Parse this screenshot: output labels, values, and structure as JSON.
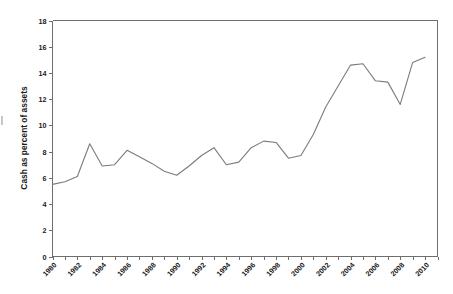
{
  "chart_data": {
    "type": "line",
    "title": "",
    "subtitle": "",
    "xlabel": "",
    "ylabel": "Cash as percent of assets",
    "xlim": [
      1980,
      2011
    ],
    "ylim": [
      0,
      18
    ],
    "y_ticks": [
      0,
      2,
      4,
      6,
      8,
      10,
      12,
      14,
      16,
      18
    ],
    "y_tick_labels": [
      "0",
      "2",
      "4",
      "6",
      "8",
      "10",
      "12",
      "14",
      "16",
      "18"
    ],
    "x_ticks": [
      1980,
      1981,
      1982,
      1983,
      1984,
      1985,
      1986,
      1987,
      1988,
      1989,
      1990,
      1991,
      1992,
      1993,
      1994,
      1995,
      1996,
      1997,
      1998,
      1999,
      2000,
      2001,
      2002,
      2003,
      2004,
      2005,
      2006,
      2007,
      2008,
      2009,
      2010,
      2011
    ],
    "x_tick_labels": [
      "1980",
      "1982",
      "1984",
      "1986",
      "1988",
      "1990",
      "1992",
      "1994",
      "1996",
      "1998",
      "2000",
      "2002",
      "2004",
      "2006",
      "2008",
      "2010"
    ],
    "x_tick_label_years": [
      1980,
      1982,
      1984,
      1986,
      1988,
      1990,
      1992,
      1994,
      1996,
      1998,
      2000,
      2002,
      2004,
      2006,
      2008,
      2010
    ],
    "x_tick_label_rotation_deg": 45,
    "grid": false,
    "legend": null,
    "legend_position": "none",
    "line_color": "#7b7b7b",
    "axis_color": "#6e6e6e",
    "x": [
      1980,
      1981,
      1982,
      1983,
      1984,
      1985,
      1986,
      1987,
      1988,
      1989,
      1990,
      1991,
      1992,
      1993,
      1994,
      1995,
      1996,
      1997,
      1998,
      1999,
      2000,
      2001,
      2002,
      2003,
      2004,
      2005,
      2006,
      2007,
      2008,
      2009,
      2010
    ],
    "values": [
      5.5,
      5.7,
      6.1,
      8.6,
      6.9,
      7.0,
      8.1,
      7.6,
      7.1,
      6.5,
      6.2,
      6.9,
      7.7,
      8.3,
      7.0,
      7.2,
      8.3,
      8.8,
      8.7,
      7.5,
      7.7,
      9.3,
      11.4,
      13.0,
      14.6,
      14.7,
      13.4,
      13.3,
      11.6,
      14.8,
      15.2
    ],
    "series": [
      {
        "name": "Cash as percent of assets",
        "values": [
          5.5,
          5.7,
          6.1,
          8.6,
          6.9,
          7.0,
          8.1,
          7.6,
          7.1,
          6.5,
          6.2,
          6.9,
          7.7,
          8.3,
          7.0,
          7.2,
          8.3,
          8.8,
          8.7,
          7.5,
          7.7,
          9.3,
          11.4,
          13.0,
          14.6,
          14.7,
          13.4,
          13.3,
          11.6,
          14.8,
          15.2
        ]
      }
    ]
  }
}
